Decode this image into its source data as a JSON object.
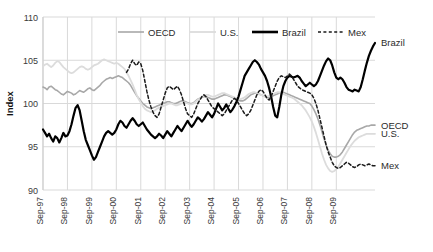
{
  "chart_data": {
    "type": "line",
    "title": "",
    "xlabel": "",
    "ylabel": "Index",
    "ylim": [
      90,
      110
    ],
    "yticks": [
      90,
      95,
      100,
      105,
      110
    ],
    "grid": true,
    "legend_position": "top-center",
    "x_tick_labels": [
      "Sep-97",
      "Sep-98",
      "Sep-99",
      "Sep-00",
      "Sep-01",
      "Sep-02",
      "Sep-03",
      "Sep-04",
      "Sep-05",
      "Sep-06",
      "Sep-07",
      "Sep-08",
      "Sep-09"
    ],
    "x_start": "Sep-97",
    "x_end": "Sep-10",
    "x_frequency": "monthly",
    "end_labels": [
      "Brazil",
      "OECD",
      "U.S.",
      "Mex"
    ],
    "series": [
      {
        "name": "OECD",
        "color": "#a8a8a8",
        "style": "solid",
        "width": 1.6,
        "end_label": "OECD",
        "values": [
          101.9,
          101.8,
          101.6,
          101.9,
          102.0,
          101.8,
          101.6,
          101.5,
          101.3,
          101.1,
          101.0,
          101.2,
          101.4,
          101.3,
          101.2,
          101.0,
          101.1,
          101.3,
          101.5,
          101.4,
          101.3,
          101.5,
          101.7,
          101.8,
          101.6,
          101.5,
          101.7,
          101.9,
          102.1,
          102.4,
          102.6,
          102.8,
          102.9,
          103.0,
          102.9,
          103.0,
          103.1,
          103.2,
          103.1,
          103.0,
          102.8,
          102.6,
          102.4,
          102.1,
          101.7,
          101.3,
          100.9,
          100.6,
          100.3,
          100.0,
          99.8,
          99.6,
          99.5,
          99.4,
          99.5,
          99.6,
          99.7,
          99.8,
          99.9,
          100.0,
          100.1,
          100.2,
          100.2,
          100.1,
          100.0,
          100.0,
          100.1,
          100.2,
          100.3,
          100.3,
          100.2,
          100.1,
          100.0,
          100.0,
          100.1,
          100.3,
          100.5,
          100.6,
          100.7,
          100.8,
          100.8,
          100.7,
          100.6,
          100.5,
          100.5,
          100.6,
          100.7,
          100.8,
          100.9,
          101.0,
          101.0,
          100.9,
          100.8,
          100.7,
          100.6,
          100.5,
          100.4,
          100.3,
          100.3,
          100.4,
          100.6,
          100.8,
          101.0,
          101.1,
          101.2,
          101.2,
          101.1,
          101.0,
          100.9,
          100.8,
          100.7,
          100.7,
          100.8,
          100.9,
          101.0,
          101.1,
          101.2,
          101.3,
          101.3,
          101.2,
          101.1,
          101.0,
          100.9,
          100.8,
          100.7,
          100.6,
          100.5,
          100.4,
          100.3,
          100.2,
          100.1,
          100.0,
          99.7,
          99.3,
          98.8,
          98.2,
          97.5,
          96.7,
          95.9,
          95.2,
          94.6,
          94.2,
          93.9,
          93.8,
          93.8,
          93.9,
          94.1,
          94.4,
          94.8,
          95.2,
          95.6,
          96.0,
          96.4,
          96.7,
          96.9,
          97.0,
          97.1,
          97.2,
          97.3,
          97.4,
          97.4,
          97.5,
          97.5,
          97.5
        ]
      },
      {
        "name": "U.S.",
        "color": "#dcdcdc",
        "style": "solid",
        "width": 1.8,
        "end_label": "U.S.",
        "values": [
          104.3,
          104.5,
          104.6,
          104.4,
          104.2,
          104.4,
          104.7,
          104.9,
          104.8,
          104.5,
          104.2,
          104.0,
          103.8,
          103.6,
          103.5,
          103.6,
          103.8,
          104.0,
          104.2,
          104.3,
          104.2,
          104.0,
          103.9,
          104.0,
          104.2,
          104.4,
          104.5,
          104.6,
          104.8,
          105.0,
          105.1,
          105.0,
          104.9,
          104.8,
          104.7,
          104.6,
          104.7,
          104.6,
          104.4,
          104.2,
          104.0,
          103.6,
          103.2,
          102.7,
          102.2,
          101.6,
          101.0,
          100.5,
          100.1,
          99.7,
          99.4,
          99.2,
          99.1,
          99.0,
          99.1,
          99.2,
          99.4,
          99.5,
          99.6,
          99.7,
          99.8,
          99.9,
          100.0,
          100.0,
          99.9,
          99.8,
          99.8,
          99.9,
          100.0,
          100.1,
          100.1,
          100.0,
          99.9,
          99.9,
          100.0,
          100.2,
          100.4,
          100.6,
          100.8,
          100.9,
          101.0,
          101.0,
          100.9,
          100.8,
          100.8,
          100.9,
          101.0,
          101.1,
          101.2,
          101.2,
          101.1,
          101.0,
          100.9,
          100.8,
          100.7,
          100.6,
          100.5,
          100.5,
          100.6,
          100.7,
          100.9,
          101.1,
          101.2,
          101.3,
          101.3,
          101.2,
          101.1,
          101.0,
          100.9,
          100.8,
          100.8,
          100.9,
          101.0,
          101.1,
          101.2,
          101.3,
          101.3,
          101.2,
          101.1,
          101.0,
          100.9,
          100.8,
          100.7,
          100.6,
          100.4,
          100.2,
          100.0,
          99.8,
          99.5,
          99.2,
          98.8,
          98.4,
          97.9,
          97.3,
          96.6,
          95.8,
          95.0,
          94.2,
          93.5,
          92.9,
          92.5,
          92.2,
          92.1,
          92.2,
          92.4,
          92.7,
          93.1,
          93.5,
          93.9,
          94.3,
          94.7,
          95.1,
          95.4,
          95.7,
          95.9,
          96.1,
          96.2,
          96.3,
          96.4,
          96.5,
          96.5,
          96.5,
          96.5,
          96.5
        ]
      },
      {
        "name": "Brazil",
        "color": "#000000",
        "style": "solid",
        "width": 2.2,
        "end_label": "Brazil",
        "values": [
          97.0,
          96.6,
          96.2,
          96.5,
          96.0,
          95.6,
          96.2,
          96.0,
          95.5,
          96.0,
          96.6,
          96.2,
          96.3,
          96.8,
          97.6,
          98.6,
          99.5,
          99.8,
          99.2,
          98.0,
          96.8,
          95.8,
          95.2,
          94.6,
          94.0,
          93.5,
          93.8,
          94.4,
          95.0,
          95.6,
          96.2,
          96.6,
          96.8,
          96.6,
          96.4,
          96.6,
          97.0,
          97.6,
          98.0,
          97.8,
          97.4,
          97.2,
          97.6,
          98.0,
          98.3,
          98.0,
          97.6,
          97.4,
          97.6,
          97.8,
          97.4,
          97.0,
          96.7,
          96.4,
          96.2,
          96.0,
          96.2,
          96.5,
          96.3,
          96.0,
          96.4,
          96.8,
          96.5,
          96.2,
          96.6,
          97.0,
          97.4,
          97.1,
          96.8,
          97.2,
          97.6,
          98.0,
          97.6,
          97.3,
          97.6,
          98.0,
          98.4,
          98.2,
          97.9,
          98.2,
          98.6,
          99.0,
          98.7,
          98.4,
          98.8,
          99.4,
          100.0,
          99.6,
          99.2,
          99.5,
          99.9,
          99.4,
          99.0,
          99.3,
          99.7,
          100.2,
          100.8,
          101.6,
          102.4,
          103.2,
          103.6,
          104.0,
          104.4,
          104.8,
          105.0,
          104.8,
          104.5,
          104.0,
          103.6,
          103.2,
          102.6,
          101.8,
          100.8,
          99.6,
          98.6,
          98.4,
          99.6,
          101.0,
          102.0,
          102.6,
          103.0,
          103.2,
          103.1,
          103.0,
          103.1,
          103.2,
          103.0,
          102.6,
          102.3,
          102.0,
          102.2,
          102.4,
          102.2,
          102.0,
          102.2,
          102.6,
          103.2,
          103.8,
          104.4,
          104.9,
          105.2,
          105.0,
          104.4,
          103.6,
          103.0,
          102.8,
          103.0,
          102.8,
          102.4,
          101.9,
          101.6,
          101.5,
          101.4,
          101.6,
          101.5,
          101.4,
          101.9,
          102.8,
          103.8,
          104.7,
          105.5,
          106.1,
          106.6,
          107.0
        ]
      },
      {
        "name": "Mex",
        "color": "#1a1a1a",
        "style": "dashed",
        "width": 1.5,
        "end_label": "Mex",
        "values": [
          null,
          null,
          null,
          null,
          null,
          null,
          null,
          null,
          null,
          null,
          null,
          null,
          null,
          null,
          null,
          null,
          null,
          null,
          null,
          null,
          null,
          null,
          null,
          null,
          null,
          null,
          null,
          null,
          null,
          null,
          null,
          null,
          null,
          null,
          null,
          null,
          null,
          null,
          null,
          null,
          null,
          103.6,
          104.0,
          104.6,
          105.0,
          104.6,
          104.4,
          104.8,
          104.6,
          103.8,
          102.6,
          101.4,
          100.4,
          99.6,
          99.0,
          98.6,
          98.4,
          98.8,
          99.6,
          100.4,
          101.2,
          101.8,
          102.0,
          101.8,
          101.6,
          101.8,
          102.0,
          101.6,
          101.0,
          100.2,
          99.4,
          98.8,
          98.6,
          98.4,
          98.8,
          99.4,
          100.0,
          100.4,
          100.8,
          101.0,
          100.8,
          100.4,
          100.0,
          99.6,
          99.4,
          99.2,
          99.0,
          98.8,
          98.6,
          98.8,
          99.2,
          99.6,
          100.0,
          100.4,
          100.6,
          100.4,
          100.0,
          99.6,
          99.2,
          98.8,
          98.6,
          98.8,
          99.2,
          99.8,
          100.4,
          101.0,
          101.4,
          101.6,
          101.4,
          101.0,
          100.6,
          100.4,
          100.8,
          101.4,
          102.0,
          102.6,
          103.0,
          103.2,
          103.1,
          103.0,
          103.2,
          103.4,
          103.2,
          102.8,
          102.4,
          102.0,
          101.8,
          101.6,
          101.5,
          101.4,
          101.3,
          101.2,
          101.0,
          100.6,
          100.0,
          99.2,
          98.2,
          97.2,
          96.2,
          95.2,
          94.4,
          93.8,
          93.2,
          92.8,
          92.6,
          92.5,
          92.6,
          92.8,
          93.0,
          93.2,
          93.1,
          92.9,
          92.7,
          92.6,
          92.7,
          92.9,
          93.0,
          92.9,
          92.8,
          92.9,
          93.0,
          92.9,
          92.8,
          92.8
        ]
      }
    ]
  },
  "legend": {
    "items": [
      {
        "label": "OECD"
      },
      {
        "label": "U.S."
      },
      {
        "label": "Brazil"
      },
      {
        "label": "Mex"
      }
    ]
  }
}
